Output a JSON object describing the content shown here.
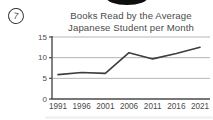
{
  "question_marker": {
    "label": "7"
  },
  "colors": {
    "line": "#3d3d3d",
    "grid": "#b5b5b5",
    "axis": "#4a4a4a",
    "text": "#4b4b4b",
    "blob": "#0e0e0e"
  },
  "chart_data": {
    "type": "line",
    "title": "Books Read by the Average Japanese Student per Month",
    "title_lines": [
      "Books Read by the Average",
      "Japanese Student per Month"
    ],
    "categories": [
      "1991",
      "1996",
      "2001",
      "2006",
      "2011",
      "2016",
      "2021"
    ],
    "values": [
      5.9,
      6.4,
      6.2,
      11.2,
      9.7,
      11.0,
      12.5
    ],
    "y_ticks": [
      15,
      10,
      5,
      0
    ],
    "ylim": [
      0,
      15
    ],
    "xlabel": "",
    "ylabel": "",
    "grid": "horizontal",
    "legend": "none"
  }
}
